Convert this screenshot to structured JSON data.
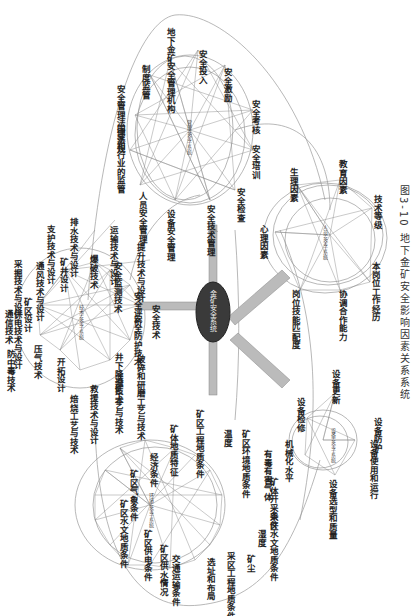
{
  "caption": "图3-10  地下金矿安全影响因素关系系统",
  "main_node": {
    "label": "金矿安全系统"
  },
  "clusters": {
    "management": {
      "center": "管理安全子系统",
      "nodes": [
        "地下金矿安全管理机构",
        "安全投入",
        "安全激励",
        "安全考核",
        "安全培训",
        "安全检查",
        "安全技术管理",
        "设备安全管理",
        "人员安全管理",
        "国家和行业的监管",
        "安全管理法律法规",
        "制度监管"
      ]
    },
    "human": {
      "center": "人员安全子系统",
      "nodes": [
        "生理因素",
        "教育因素",
        "技术等级",
        "本岗位工作经历",
        "协调合作能力",
        "岗位技能匹配度",
        "心理因素"
      ]
    },
    "technology": {
      "center": "技术安全子系统",
      "nodes": [
        "支护技术与设计",
        "排水技术与设计",
        "运输技术与设计",
        "提升技术与设计",
        "采掘技术与设计",
        "通风技术与设计",
        "矿井设计",
        "爆破技术",
        "安全监测技术",
        "安全评价",
        "安全技术",
        "安全防护技术",
        "井下降温技术",
        "破碎和研磨工艺与技术",
        "选矿工艺与技术",
        "救援技术与设计",
        "焙烧工艺与技术",
        "压气技术",
        "开拓设计",
        "防中毒技术",
        "供电技术与设计",
        "通信技术",
        "矿区设计"
      ]
    },
    "environment": {
      "center": "环境安全子系统",
      "nodes": [
        "矿体地质特征",
        "矿区工程地质条件",
        "温度",
        "矿区环境地质条件",
        "有毒有害气体",
        "矿体开采条件",
        "采区水文地质条件",
        "湿度",
        "矿尘",
        "采区工程地质条件",
        "选址和布局",
        "交通运输条件",
        "矿区供水情况",
        "矿区供电条件",
        "矿区水文地质条件",
        "矿区气象条件",
        "经济条件"
      ]
    },
    "equipment": {
      "center": "设备安全子系统",
      "nodes": [
        "设备更新",
        "设备检修",
        "机械化水平",
        "设备选型和质量",
        "设备使用和运行",
        "设备防护"
      ]
    }
  },
  "colors": {
    "edge": "#8a8a8a",
    "circle": "#9a9a9a",
    "main_node": "#3a3a3a",
    "text": "#222222"
  }
}
